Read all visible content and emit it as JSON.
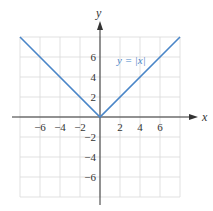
{
  "chart_data": {
    "type": "line",
    "title": "",
    "xlabel": "x",
    "ylabel": "y",
    "xlim": [
      -8,
      8
    ],
    "ylim": [
      -8,
      8
    ],
    "grid": true,
    "x_ticks": [
      -6,
      -4,
      -2,
      2,
      4,
      6
    ],
    "y_ticks": [
      6,
      4,
      2,
      -2,
      -4,
      -6
    ],
    "x_tick_labels": [
      "−6",
      "−4",
      "−2",
      "2",
      "4",
      "6"
    ],
    "y_tick_labels": [
      "6",
      "4",
      "2",
      "−2",
      "−4",
      "−6"
    ],
    "series": [
      {
        "name": "y = |x|",
        "x": [
          -8,
          0,
          8
        ],
        "y": [
          8,
          0,
          8
        ],
        "color": "#4a86c8"
      }
    ],
    "annotations": [
      {
        "text": "y = |x|",
        "x": 3.2,
        "y": 6
      }
    ]
  },
  "labels": {
    "x_axis": "x",
    "y_axis": "y",
    "equation": "y = |x|"
  },
  "colors": {
    "line": "#4a86c8",
    "grid": "#d9d9d9",
    "axis": "#333333"
  }
}
